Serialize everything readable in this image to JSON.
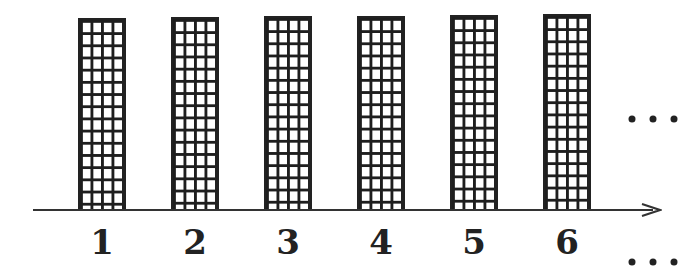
{
  "diagram": {
    "columns": [
      {
        "label": "1",
        "left": 78,
        "top": 18
      },
      {
        "label": "2",
        "left": 171,
        "top": 17
      },
      {
        "label": "3",
        "left": 264,
        "top": 16
      },
      {
        "label": "4",
        "left": 357,
        "top": 16
      },
      {
        "label": "5",
        "left": 450,
        "top": 15
      },
      {
        "label": "6",
        "left": 543,
        "top": 14
      }
    ],
    "grid": {
      "cols": 4,
      "rows": 16
    },
    "continuation_top": "…",
    "continuation_bottom": "…",
    "axis": {
      "direction": "right",
      "arrow": true
    }
  }
}
